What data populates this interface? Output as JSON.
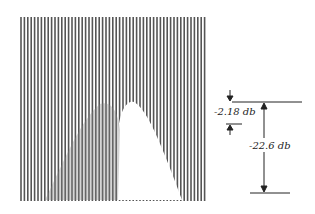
{
  "figure": {
    "type": "raster-scan line pattern with attenuation annotations",
    "line_color": "#555555",
    "background": "#ffffff",
    "annotations": {
      "small": {
        "label": "-2.18 db"
      },
      "large": {
        "label": "-22.6 db"
      }
    }
  }
}
